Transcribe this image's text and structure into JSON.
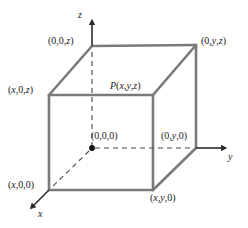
{
  "figure": {
    "type": "diagram",
    "stroke_color": "#7a7a7a",
    "axis_color": "#2b2b2b",
    "text_color": "#1a1a1a",
    "background": "#ffffff"
  },
  "axes": [
    {
      "name": "z-axis",
      "label": "z",
      "direction": "up"
    },
    {
      "name": "y-axis",
      "label": "y",
      "direction": "right"
    },
    {
      "name": "x-axis",
      "label": "x",
      "direction": "down-left"
    }
  ],
  "vertices": [
    {
      "name": "top-back-left",
      "label": "(0,0,z)",
      "px": [
        92,
        46
      ]
    },
    {
      "name": "top-back-right",
      "label": "(0,y,z)",
      "px": [
        196,
        45
      ]
    },
    {
      "name": "top-front-left",
      "label": "(x,0,z)",
      "px": [
        49,
        95
      ]
    },
    {
      "name": "top-front-right",
      "label": "P(x,y,z)",
      "px": [
        153,
        95
      ]
    },
    {
      "name": "origin",
      "label": "(0,0,0)",
      "px": [
        92,
        148
      ]
    },
    {
      "name": "bottom-back-right",
      "label": "(0,y,0)",
      "px": [
        196,
        148
      ]
    },
    {
      "name": "bottom-front-left",
      "label": "(x,0,0)",
      "px": [
        49,
        190
      ]
    },
    {
      "name": "bottom-front-right",
      "label": "(x,y,0)",
      "px": [
        153,
        190
      ]
    }
  ],
  "labels": {
    "top_back_left": "(0,0,z)",
    "top_back_right": "(0,y,z)",
    "top_front_left": "(x,0,z)",
    "point_p": "P(x,y,z)",
    "origin": "(0,0,0)",
    "bottom_back_right": "(0,y,0)",
    "bottom_front_left": "(x,0,0)",
    "bottom_front_right": "(x,y,0)",
    "axis_z": "z",
    "axis_y": "y",
    "axis_x": "x"
  }
}
